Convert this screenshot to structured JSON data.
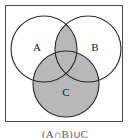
{
  "figure": {
    "caption": "(A∩B)∪C",
    "frame": {
      "border_color": "#4a4a4a",
      "background_color": "#ffffff"
    },
    "colors": {
      "shaded_region": "#b8b8b8",
      "unshaded_region": "#ffffff",
      "outline": "#2b2b2b",
      "label_text": "#1a1a1a"
    },
    "sets": [
      {
        "id": "A",
        "label": "A",
        "position": "top-left",
        "shaded": false,
        "cx": 43,
        "cy": 48,
        "r": 33
      },
      {
        "id": "B",
        "label": "B",
        "position": "top-right",
        "shaded": false,
        "cx": 87,
        "cy": 48,
        "r": 33
      },
      {
        "id": "C",
        "label": "C",
        "position": "bottom-center",
        "shaded": true,
        "cx": 65,
        "cy": 83,
        "r": 33
      }
    ],
    "shaded_regions": [
      "A ∩ B",
      "A ∩ B ∩ C",
      "C"
    ],
    "label_positions": [
      {
        "id": "A",
        "x": 36,
        "y": 47
      },
      {
        "id": "B",
        "x": 94,
        "y": 47
      },
      {
        "id": "C",
        "x": 65,
        "y": 92
      }
    ]
  }
}
